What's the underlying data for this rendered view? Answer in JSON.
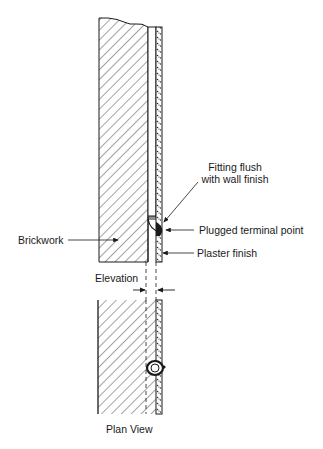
{
  "diagram": {
    "type": "construction-detail",
    "labels": {
      "fitting_line1": "Fitting flush",
      "fitting_line2": "with wall finish",
      "plugged_terminal": "Plugged terminal point",
      "plaster_finish": "Plaster finish",
      "brickwork": "Brickwork",
      "elevation": "Elevation",
      "plan_view": "Plan View"
    },
    "colors": {
      "line": "#1a1a1a",
      "background": "#ffffff"
    }
  }
}
